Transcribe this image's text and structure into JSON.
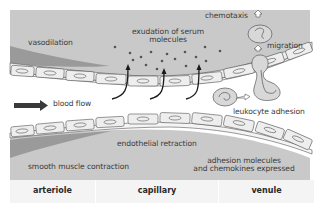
{
  "labels": {
    "vasodilation": "vasodilation",
    "exudation_line1": "exudation of serum",
    "exudation_line2": "molecules",
    "chemotaxis": "chemotaxis",
    "migration": "migration",
    "blood_flow": "blood flow",
    "leukocyte_adhesion": "leukocyte adhesion",
    "endothelial_retraction": "endothelial retraction",
    "smooth_muscle": "smooth muscle contraction",
    "adhesion_line1": "adhesion molecules",
    "adhesion_line2": "and chemokines expressed"
  },
  "footer": {
    "sections": [
      {
        "label": "arteriole"
      },
      {
        "label": "capillary"
      },
      {
        "label": "venule"
      }
    ]
  },
  "colors": {
    "tissue": "#c9c9c9",
    "tissue_dark": "#9a9a9a",
    "cell_fill": "#eeeeee",
    "outline": "#555555",
    "footer_bg": "#f4f4f4",
    "arrow": "#3a3a3a"
  }
}
